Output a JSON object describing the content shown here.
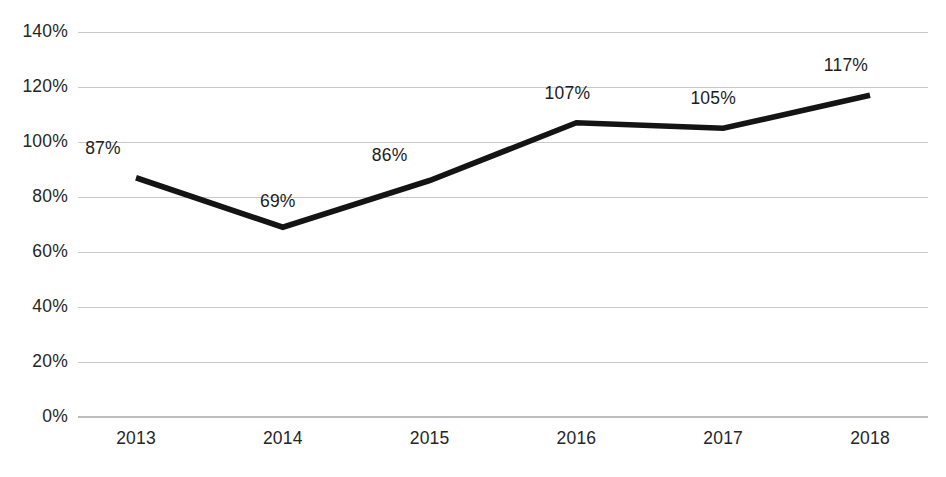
{
  "chart_data": {
    "type": "line",
    "title": "",
    "subtitle": "",
    "xlabel": "",
    "ylabel": "",
    "categories": [
      "2013",
      "2014",
      "2015",
      "2016",
      "2017",
      "2018"
    ],
    "values": [
      87,
      69,
      86,
      107,
      105,
      117
    ],
    "point_labels": [
      "87%",
      "69%",
      "86%",
      "107%",
      "105%",
      "117%"
    ],
    "ylim": [
      0,
      140
    ],
    "ytick_values": [
      0,
      20,
      40,
      60,
      80,
      100,
      120,
      140
    ],
    "ytick_labels": [
      "0%",
      "20%",
      "40%",
      "60%",
      "80%",
      "100%",
      "120%",
      "140%"
    ],
    "grid": true,
    "legend": false,
    "legend_position": "none",
    "series": [
      {
        "name": "",
        "values": [
          87,
          69,
          86,
          107,
          105,
          117
        ],
        "color": "#141414"
      }
    ],
    "colors": {
      "line": "#141414",
      "gridline": "#c9c9c9",
      "axis": "#bdbdbd",
      "text": "#262626",
      "background": "#ffffff"
    }
  }
}
